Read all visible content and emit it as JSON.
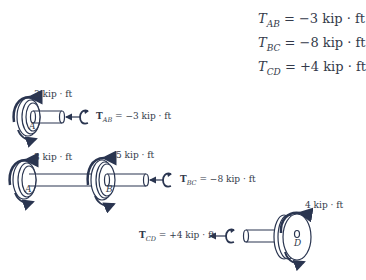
{
  "summary": {
    "equations": [
      {
        "symbol": "T",
        "subscript": "AB",
        "value": "= −3 kip · ft"
      },
      {
        "symbol": "T",
        "subscript": "BC",
        "value": "= −8 kip · ft"
      },
      {
        "symbol": "T",
        "subscript": "CD",
        "value": "= +4 kip · ft"
      }
    ]
  },
  "section_ab": {
    "applied_torque": "3 kip · ft",
    "internal_symbol": "T",
    "internal_subscript": "AB",
    "internal_value": " = −3 kip · ft",
    "point": "A"
  },
  "section_bc": {
    "applied_torque_a": "3 kip · ft",
    "applied_torque_b": "5 kip · ft",
    "internal_symbol": "T",
    "internal_subscript": "BC",
    "internal_value": " = −8 kip · ft",
    "point_a": "A",
    "point_b": "B"
  },
  "section_cd": {
    "applied_torque": "4 kip · ft",
    "internal_symbol": "T",
    "internal_subscript": "CD",
    "internal_value": " = +4 kip · ft",
    "point": "D"
  },
  "colors": {
    "line": "#2a3550",
    "shaft_fill": "#ffffff",
    "text": "#333a4a"
  }
}
